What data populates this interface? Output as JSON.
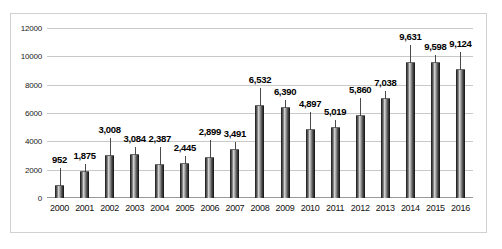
{
  "chart_data": {
    "type": "bar",
    "title": "",
    "xlabel": "",
    "ylabel": "",
    "ylim": [
      0,
      12000
    ],
    "ytick_step": 2000,
    "yticks": [
      "0",
      "2000",
      "4000",
      "6000",
      "8000",
      "10000",
      "12000"
    ],
    "grid": true,
    "legend": "none",
    "categories": [
      "2000",
      "2001",
      "2002",
      "2003",
      "2004",
      "2005",
      "2006",
      "2007",
      "2008",
      "2009",
      "2010",
      "2011",
      "2012",
      "2013",
      "2014",
      "2015",
      "2016"
    ],
    "values": [
      952,
      1875,
      3008,
      3084,
      2387,
      2445,
      2899,
      3491,
      6532,
      6390,
      4897,
      5019,
      5860,
      7038,
      9631,
      9598,
      9124
    ],
    "data_labels": [
      "952",
      "1,875",
      "3,008",
      "3,084",
      "2,387",
      "2,445",
      "2,899",
      "3,491",
      "6,532",
      "6,390",
      "4,897",
      "5,019",
      "5,860",
      "7,038",
      "9,631",
      "9,598",
      "9,124"
    ],
    "series": [
      {
        "name": "Series 1",
        "values": [
          952,
          1875,
          3008,
          3084,
          2387,
          2445,
          2899,
          3491,
          6532,
          6390,
          4897,
          5019,
          5860,
          7038,
          9631,
          9598,
          9124
        ]
      }
    ],
    "colors": {
      "bar_dark": "#1a1a1a",
      "bar_highlight": "#d8d8d8",
      "gridline": "#c8c8c8",
      "axis": "#9a9a9a",
      "border": "#d0d0d0",
      "background": "#ffffff",
      "label_text": "#000000"
    }
  }
}
